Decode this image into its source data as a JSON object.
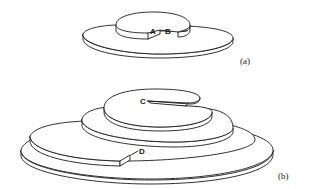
{
  "figure": {
    "panels": [
      {
        "id": "a",
        "caption": "(a)",
        "description": "Two-level spiral disc with a step between points A and B",
        "points": [
          {
            "label": "A"
          },
          {
            "label": "B"
          }
        ]
      },
      {
        "id": "b",
        "caption": "(b)",
        "description": "Multi-level spiral terrace descending from point C to point D",
        "points": [
          {
            "label": "C"
          },
          {
            "label": "D"
          }
        ]
      }
    ]
  }
}
